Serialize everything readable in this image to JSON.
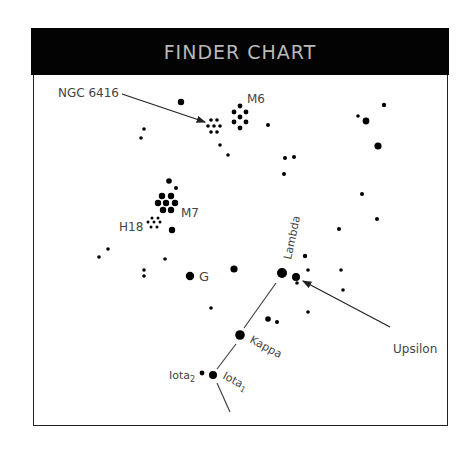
{
  "header": {
    "title": "FINDER CHART"
  },
  "colors": {
    "header_bg": "#030303",
    "header_text": "#b9b9b9",
    "star": "#000000",
    "line": "#444444",
    "label": "#444444"
  },
  "labels": {
    "ngc6416": "NGC 6416",
    "m6": "M6",
    "m7": "M7",
    "h18": "H18",
    "g": "G",
    "lambda": "Lambda",
    "upsilon": "Upsilon",
    "kappa": "Kappa",
    "iota1": "Iota",
    "iota1_sub": "1",
    "iota2": "Iota",
    "iota2_sub": "2"
  },
  "stars": [
    {
      "x": 181,
      "y": 102,
      "r": 3.2
    },
    {
      "x": 144,
      "y": 129,
      "r": 1.8
    },
    {
      "x": 141,
      "y": 138,
      "r": 1.8
    },
    {
      "x": 220,
      "y": 145,
      "r": 1.8
    },
    {
      "x": 228,
      "y": 155,
      "r": 1.8
    },
    {
      "x": 268,
      "y": 125,
      "r": 2
    },
    {
      "x": 285,
      "y": 158,
      "r": 2
    },
    {
      "x": 294,
      "y": 157,
      "r": 2
    },
    {
      "x": 284,
      "y": 174,
      "r": 2
    },
    {
      "x": 358,
      "y": 116,
      "r": 1.8
    },
    {
      "x": 366,
      "y": 121,
      "r": 3.4
    },
    {
      "x": 384,
      "y": 105,
      "r": 2.2
    },
    {
      "x": 378,
      "y": 146,
      "r": 3.6
    },
    {
      "x": 169,
      "y": 181,
      "r": 2.8
    },
    {
      "x": 176,
      "y": 188,
      "r": 2
    },
    {
      "x": 172,
      "y": 230,
      "r": 3.2
    },
    {
      "x": 108,
      "y": 249,
      "r": 1.8
    },
    {
      "x": 99,
      "y": 257,
      "r": 1.8
    },
    {
      "x": 165,
      "y": 259,
      "r": 1.8
    },
    {
      "x": 144,
      "y": 270,
      "r": 1.8
    },
    {
      "x": 144,
      "y": 276,
      "r": 1.8
    },
    {
      "x": 190,
      "y": 276,
      "r": 4.2
    },
    {
      "x": 234,
      "y": 269,
      "r": 3.6
    },
    {
      "x": 362,
      "y": 194,
      "r": 2
    },
    {
      "x": 377,
      "y": 219,
      "r": 2
    },
    {
      "x": 339,
      "y": 229,
      "r": 2
    },
    {
      "x": 305,
      "y": 256,
      "r": 2.2
    },
    {
      "x": 308,
      "y": 270,
      "r": 1.8
    },
    {
      "x": 341,
      "y": 270,
      "r": 1.8
    },
    {
      "x": 343,
      "y": 290,
      "r": 1.8
    },
    {
      "x": 282,
      "y": 273,
      "r": 5
    },
    {
      "x": 296,
      "y": 277,
      "r": 4
    },
    {
      "x": 297,
      "y": 283,
      "r": 1.8
    },
    {
      "x": 308,
      "y": 312,
      "r": 1.8
    },
    {
      "x": 211,
      "y": 308,
      "r": 1.8
    },
    {
      "x": 268,
      "y": 319,
      "r": 2.8
    },
    {
      "x": 277,
      "y": 322,
      "r": 2
    },
    {
      "x": 240,
      "y": 335,
      "r": 4.8
    },
    {
      "x": 202,
      "y": 373,
      "r": 2.4
    },
    {
      "x": 213,
      "y": 375,
      "r": 4
    },
    {
      "x": 100,
      "y": 288,
      "r": 0
    }
  ],
  "clusters": [
    {
      "name": "ngc6416",
      "dots": [
        [
          211,
          120
        ],
        [
          217,
          120
        ],
        [
          208,
          126
        ],
        [
          214,
          126
        ],
        [
          220,
          126
        ],
        [
          211,
          132
        ],
        [
          217,
          132
        ]
      ],
      "r": 1.8
    },
    {
      "name": "m6",
      "dots": [
        [
          240,
          106
        ],
        [
          234,
          112
        ],
        [
          246,
          112
        ],
        [
          240,
          117
        ],
        [
          234,
          122
        ],
        [
          246,
          122
        ],
        [
          240,
          128
        ]
      ],
      "r": 2.4
    },
    {
      "name": "m7",
      "dots": [
        [
          162,
          196
        ],
        [
          171,
          196
        ],
        [
          158,
          203
        ],
        [
          166,
          203
        ],
        [
          175,
          203
        ],
        [
          163,
          210
        ],
        [
          171,
          210
        ]
      ],
      "r": 3.2
    },
    {
      "name": "h18",
      "dots": [
        [
          152,
          218
        ],
        [
          158,
          218
        ],
        [
          148,
          222
        ],
        [
          154,
          222
        ],
        [
          160,
          222
        ],
        [
          151,
          227
        ],
        [
          157,
          227
        ]
      ],
      "r": 1.5
    }
  ],
  "lines": [
    {
      "name": "lambda-kappa",
      "x1": 276,
      "y1": 283,
      "x2": 244,
      "y2": 328
    },
    {
      "name": "kappa-iota",
      "x1": 236,
      "y1": 344,
      "x2": 217,
      "y2": 369
    },
    {
      "name": "iota-tail",
      "x1": 217,
      "y1": 383,
      "x2": 230,
      "y2": 412
    }
  ],
  "arrows": [
    {
      "name": "ngc6416-arrow",
      "x1": 122,
      "y1": 94,
      "x2": 205,
      "y2": 122
    },
    {
      "name": "upsilon-arrow",
      "x1": 390,
      "y1": 327,
      "x2": 303,
      "y2": 281
    }
  ]
}
